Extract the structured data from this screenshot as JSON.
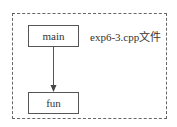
{
  "diagram": {
    "container_label": "exp6-3.cpp文件",
    "nodes": [
      {
        "id": "main",
        "label": "main"
      },
      {
        "id": "fun",
        "label": "fun"
      }
    ],
    "edges": [
      {
        "from": "main",
        "to": "fun"
      }
    ]
  }
}
